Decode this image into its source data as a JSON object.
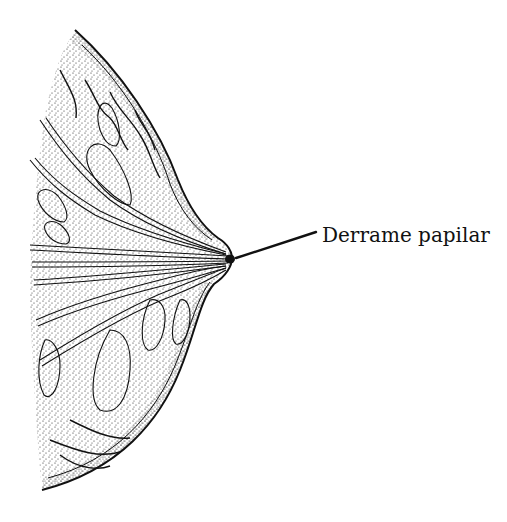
{
  "figure": {
    "labels": [
      {
        "text": "Derrame papilar",
        "points_to": "nipple"
      }
    ]
  },
  "colors": {
    "ink": "#111111",
    "background": "#ffffff"
  }
}
